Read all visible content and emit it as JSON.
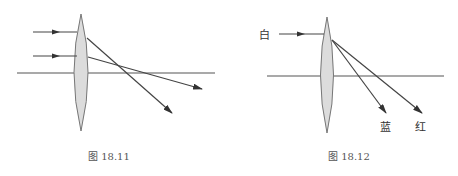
{
  "figures": [
    {
      "caption": "图 18.11",
      "description": "Convex lens with two parallel incident rays refracting and crossing the principal axis",
      "colors": {
        "lens_fill": "#dcdcdc",
        "lens_stroke": "#777777",
        "line": "#444444"
      }
    },
    {
      "caption": "图 18.12",
      "incident_label": "白",
      "dispersed_labels": [
        "蓝",
        "红"
      ],
      "description": "Convex lens dispersing white light into blue and red rays",
      "colors": {
        "lens_fill": "#dcdcdc",
        "lens_stroke": "#777777",
        "line": "#444444"
      }
    }
  ]
}
